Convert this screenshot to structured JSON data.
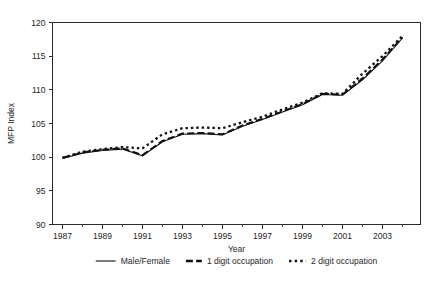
{
  "chart_data": {
    "type": "line",
    "title": "",
    "xlabel": "Year",
    "ylabel": "MFP Index",
    "xlim": [
      1986.5,
      2004.9
    ],
    "ylim": [
      90,
      120
    ],
    "grid": false,
    "legend_position": "bottom",
    "y_ticks": [
      90,
      95,
      100,
      105,
      110,
      115,
      120
    ],
    "x_ticks": [
      1987,
      1989,
      1991,
      1993,
      1995,
      1997,
      1999,
      2001,
      2003
    ],
    "x_minor_ticks": [
      1988,
      1990,
      1992,
      1994,
      1996,
      1998,
      2000,
      2002,
      2004
    ],
    "x": [
      1987,
      1988,
      1989,
      1990,
      1991,
      1992,
      1993,
      1994,
      1995,
      1996,
      1997,
      1998,
      1999,
      2000,
      2001,
      2002,
      2003,
      2004
    ],
    "series": [
      {
        "name": "Male/Female",
        "style": "solid",
        "values": [
          99.8,
          100.6,
          101.0,
          101.2,
          100.2,
          102.3,
          103.4,
          103.5,
          103.3,
          104.6,
          105.6,
          106.7,
          107.8,
          109.3,
          109.2,
          111.5,
          114.3,
          117.7
        ]
      },
      {
        "name": "1 digit occupation",
        "style": "dashed",
        "values": [
          99.9,
          100.7,
          101.1,
          101.3,
          100.3,
          102.4,
          103.5,
          103.6,
          103.4,
          104.7,
          105.7,
          106.8,
          107.9,
          109.4,
          109.3,
          111.7,
          114.5,
          117.8
        ]
      },
      {
        "name": "2 digit occupation",
        "style": "dotted",
        "values": [
          99.9,
          100.8,
          101.2,
          101.5,
          101.3,
          103.4,
          104.3,
          104.4,
          104.3,
          105.2,
          106.0,
          107.1,
          108.1,
          109.5,
          109.4,
          112.4,
          115.0,
          118.0
        ]
      }
    ]
  },
  "legend": {
    "items": [
      {
        "label": "Male/Female",
        "style": "solid"
      },
      {
        "label": "1 digit occupation",
        "style": "dashed"
      },
      {
        "label": "2 digit occupation",
        "style": "dotted"
      }
    ]
  },
  "colors": {
    "axis": "#2b2b2b",
    "series": "#111111",
    "background": "#ffffff"
  }
}
